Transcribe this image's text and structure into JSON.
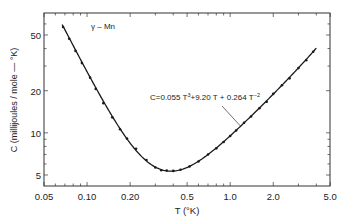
{
  "chart_data": {
    "type": "line",
    "xlabel": "T (°K)",
    "ylabel": "C (millijoules / mole - °K)",
    "xscale": "log",
    "yscale": "log",
    "xlim": [
      0.05,
      5.0
    ],
    "ylim": [
      4.4,
      62
    ],
    "x_ticks": [
      "0.05",
      "0.10",
      "0.20",
      "0.5",
      "1.0",
      "2.0",
      "5.0"
    ],
    "y_ticks": [
      "5",
      "10",
      "20",
      "50"
    ],
    "grid": false,
    "legend": null,
    "annotation": "C = 0.055 T^3 + 9.20 T + 0.264 T^-2",
    "fit": {
      "a3": 0.055,
      "a1": 9.2,
      "am2": 0.264
    },
    "series": [
      {
        "name": "fit curve",
        "style": "line",
        "x": [
          0.067,
          0.08,
          0.1,
          0.12,
          0.15,
          0.2,
          0.25,
          0.3,
          0.35,
          0.4,
          0.5,
          0.6,
          0.8,
          1.0,
          1.2,
          1.5,
          2.0,
          2.5,
          3.0,
          3.5,
          4.0
        ],
        "y": [
          59.4,
          42.0,
          27.3,
          19.4,
          13.1,
          8.44,
          6.52,
          5.7,
          5.38,
          5.33,
          5.66,
          6.26,
          7.77,
          9.52,
          11.3,
          14.1,
          19.3,
          24.9,
          29.1,
          34.6,
          40.3
        ]
      },
      {
        "name": "measured points",
        "style": "scatter",
        "x": [
          0.068,
          0.075,
          0.083,
          0.092,
          0.105,
          0.115,
          0.13,
          0.15,
          0.17,
          0.19,
          0.22,
          0.26,
          0.3,
          0.33,
          0.36,
          0.4,
          0.45,
          0.52,
          0.6,
          0.7,
          0.8,
          0.9,
          1.0,
          1.1,
          1.25,
          1.4,
          1.6,
          1.8,
          2.0,
          2.3,
          2.6,
          3.0,
          3.4,
          3.8
        ],
        "y": [
          57,
          47,
          38.5,
          31.5,
          24.8,
          20.6,
          16.3,
          12.9,
          10.6,
          9.1,
          7.7,
          6.4,
          5.65,
          5.4,
          5.38,
          5.35,
          5.45,
          5.75,
          6.25,
          7.0,
          7.75,
          8.6,
          9.5,
          10.4,
          11.8,
          13.1,
          15.0,
          16.7,
          19.0,
          21.9,
          24.5,
          29.0,
          33.0,
          38.0
        ]
      }
    ]
  },
  "axes": {
    "x_ticks": [
      "0.05",
      "0.10",
      "0.20",
      "0.5",
      "1.0",
      "2.0",
      "5.0"
    ],
    "y_ticks": [
      "50",
      "20",
      "10",
      "5"
    ],
    "xlabel": "T  (°K)",
    "ylabel": "C  (millijoules / mole — °K)"
  },
  "annotations": {
    "title": "γ – Mn",
    "eq_prefix": "C=0.055 T",
    "eq_exp1": "3",
    "eq_mid": "+9.20 T + 0.264 T",
    "eq_exp2": "−2"
  },
  "colors": {
    "line": "#1a1a1a",
    "axes": "#333333"
  }
}
